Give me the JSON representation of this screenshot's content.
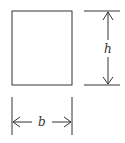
{
  "diagram": {
    "type": "rectangle-dimensions",
    "labels": {
      "height": "h",
      "width": "b"
    },
    "colors": {
      "stroke": "#333333",
      "background": "#ffffff"
    }
  }
}
